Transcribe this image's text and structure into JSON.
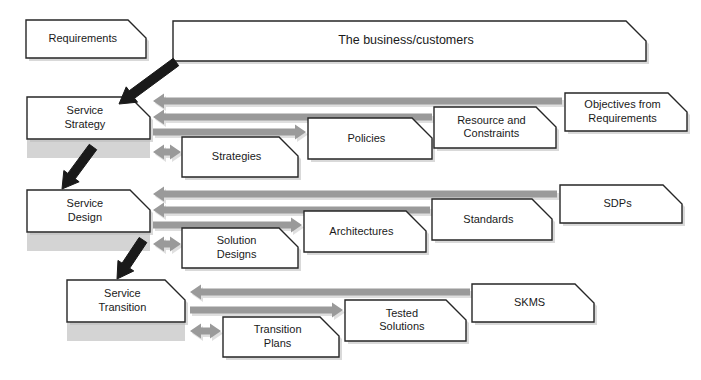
{
  "diagram": {
    "colors": {
      "box_fill": "#ffffff",
      "box_stroke": "#262626",
      "arrow_gray": "#9a9a9a",
      "arrow_black": "#1a1a1a",
      "band_gray": "#d4d4d4",
      "shadow_gray": "#b9b9b9"
    },
    "nodes": {
      "requirements": {
        "label": "Requirements",
        "x": 26,
        "y": 20,
        "w": 120,
        "h": 38,
        "notch": 18,
        "lines": [
          "Requirements"
        ]
      },
      "business_customers": {
        "label": "The business/customers",
        "x": 173,
        "y": 21,
        "w": 473,
        "h": 40,
        "notch": 20,
        "lines": [
          "The business/customers"
        ]
      },
      "service_strategy": {
        "label": "Service Strategy",
        "x": 27,
        "y": 97,
        "w": 123,
        "h": 42,
        "notch": 20,
        "lines": [
          "Service",
          "Strategy"
        ]
      },
      "strategies": {
        "label": "Strategies",
        "x": 182,
        "y": 137,
        "w": 116,
        "h": 40,
        "notch": 19,
        "lines": [
          "Strategies"
        ]
      },
      "policies": {
        "label": "Policies",
        "x": 308,
        "y": 118,
        "w": 124,
        "h": 41,
        "notch": 20,
        "lines": [
          "Policies"
        ]
      },
      "resource_and_constraints": {
        "label": "Resource and Constraints",
        "x": 434,
        "y": 107,
        "w": 122,
        "h": 41,
        "notch": 20,
        "lines": [
          "Resource and",
          "Constraints"
        ]
      },
      "objectives_from_requirements": {
        "label": "Objectives from Requirements",
        "x": 565,
        "y": 93,
        "w": 122,
        "h": 38,
        "notch": 19,
        "lines": [
          "Objectives from",
          "Requirements"
        ]
      },
      "service_design": {
        "label": "Service Design",
        "x": 27,
        "y": 190,
        "w": 123,
        "h": 42,
        "notch": 20,
        "lines": [
          "Service",
          "Design"
        ]
      },
      "solution_designs": {
        "label": "Solution Designs",
        "x": 182,
        "y": 228,
        "w": 116,
        "h": 40,
        "notch": 19,
        "lines": [
          "Solution",
          "Designs"
        ]
      },
      "architectures": {
        "label": "Architectures",
        "x": 304,
        "y": 211,
        "w": 122,
        "h": 41,
        "notch": 20,
        "lines": [
          "Architectures"
        ]
      },
      "standards": {
        "label": "Standards",
        "x": 432,
        "y": 199,
        "w": 120,
        "h": 41,
        "notch": 20,
        "lines": [
          "Standards"
        ]
      },
      "sdps": {
        "label": "SDPs",
        "x": 560,
        "y": 185,
        "w": 122,
        "h": 38,
        "notch": 19,
        "lines": [
          "SDPs"
        ]
      },
      "service_transition": {
        "label": "Service Transition",
        "x": 67,
        "y": 280,
        "w": 118,
        "h": 42,
        "notch": 20,
        "lines": [
          "Service",
          "Transition"
        ]
      },
      "transition_plans": {
        "label": "Transition Plans",
        "x": 223,
        "y": 317,
        "w": 116,
        "h": 40,
        "notch": 19,
        "lines": [
          "Transition",
          "Plans"
        ]
      },
      "tested_solutions": {
        "label": "Tested Solutions",
        "x": 345,
        "y": 300,
        "w": 121,
        "h": 41,
        "notch": 20,
        "lines": [
          "Tested",
          "Solutions"
        ]
      },
      "skms": {
        "label": "SKMS",
        "x": 472,
        "y": 284,
        "w": 122,
        "h": 38,
        "notch": 19,
        "lines": [
          "SKMS"
        ]
      }
    },
    "stages": [
      {
        "name": "service-strategy-row",
        "band_y": 140,
        "band_h": 18
      },
      {
        "name": "service-design-row",
        "band_y": 233,
        "band_h": 18
      },
      {
        "name": "service-transition-row",
        "band_y": 323,
        "band_h": 18
      }
    ],
    "arrows": {
      "strategy_row": [
        {
          "name": "objectives-to-strategy",
          "direction": "left",
          "x1": 153,
          "x2": 562,
          "y": 101
        },
        {
          "name": "resource-constraints-to-strategy",
          "direction": "left",
          "x1": 153,
          "x2": 432,
          "y": 117
        },
        {
          "name": "strategy-to-policies",
          "direction": "right",
          "x1": 153,
          "x2": 306,
          "y": 132
        },
        {
          "name": "strategy-strategies-bidirectional",
          "direction": "both",
          "x1": 153,
          "x2": 181,
          "y": 152
        }
      ],
      "design_row": [
        {
          "name": "sdps-to-design",
          "direction": "left",
          "x1": 153,
          "x2": 557,
          "y": 194
        },
        {
          "name": "standards-to-design",
          "direction": "left",
          "x1": 153,
          "x2": 430,
          "y": 210
        },
        {
          "name": "design-to-architectures",
          "direction": "right",
          "x1": 153,
          "x2": 302,
          "y": 225
        },
        {
          "name": "design-solution-designs-bidirectional",
          "direction": "both",
          "x1": 153,
          "x2": 181,
          "y": 244
        }
      ],
      "transition_row": [
        {
          "name": "skms-to-transition",
          "direction": "left",
          "x1": 190,
          "x2": 470,
          "y": 292
        },
        {
          "name": "transition-to-tested-solutions",
          "direction": "right",
          "x1": 190,
          "x2": 343,
          "y": 310
        },
        {
          "name": "transition-transition-plans-bidirectional",
          "direction": "both",
          "x1": 190,
          "x2": 221,
          "y": 331
        }
      ],
      "black": [
        {
          "name": "business-to-service-strategy",
          "x1": 176,
          "y1": 62,
          "x2": 119,
          "y2": 104
        },
        {
          "name": "service-strategy-to-service-design",
          "x1": 93,
          "y1": 147,
          "x2": 62,
          "y2": 189
        },
        {
          "name": "service-design-to-service-transition",
          "x1": 143,
          "y1": 240,
          "x2": 117,
          "y2": 279
        }
      ]
    }
  }
}
